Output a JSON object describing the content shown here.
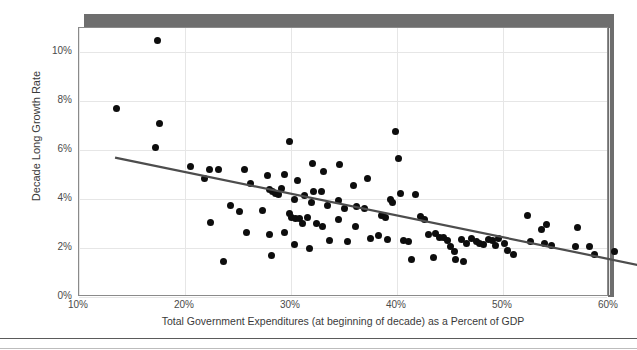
{
  "chart_data": {
    "type": "scatter",
    "title": "",
    "xlabel": "Total Government Expenditures (at beginning of decade) as a Percent of GDP",
    "ylabel": "Decade Long Growth Rate",
    "xlim": [
      10,
      60
    ],
    "ylim": [
      0,
      11
    ],
    "xticks": [
      "10%",
      "20%",
      "30%",
      "40%",
      "50%",
      "60%"
    ],
    "xtick_values": [
      10,
      20,
      30,
      40,
      50,
      60
    ],
    "yticks": [
      "0%",
      "2%",
      "4%",
      "6%",
      "8%",
      "10%"
    ],
    "ytick_values": [
      0,
      2,
      4,
      6,
      8,
      10
    ],
    "grid": true,
    "legend": "none",
    "marker_color": "#0d0d0d",
    "trendline_color": "#4d4d4d",
    "frame_color": "#8a8a8a",
    "shadow_color": "#6e6e6e",
    "trendline": {
      "type": "linear",
      "x_start": 13.4,
      "y_start": 5.7,
      "x_end": 64.0,
      "y_end": 1.2,
      "slope": -0.089,
      "intercept": 6.89
    },
    "points": [
      [
        17.4,
        10.5
      ],
      [
        13.5,
        7.7
      ],
      [
        17.6,
        7.1
      ],
      [
        17.2,
        6.1
      ],
      [
        39.9,
        6.75
      ],
      [
        29.9,
        6.35
      ],
      [
        40.1,
        5.65
      ],
      [
        20.5,
        5.35
      ],
      [
        22.3,
        5.2
      ],
      [
        23.2,
        5.2
      ],
      [
        25.6,
        5.2
      ],
      [
        32.0,
        5.45
      ],
      [
        33.1,
        5.15
      ],
      [
        34.6,
        5.4
      ],
      [
        21.8,
        4.85
      ],
      [
        27.8,
        4.95
      ],
      [
        29.4,
        5.0
      ],
      [
        30.6,
        4.75
      ],
      [
        32.1,
        4.3
      ],
      [
        32.9,
        4.3
      ],
      [
        35.9,
        4.55
      ],
      [
        37.2,
        4.85
      ],
      [
        26.2,
        4.65
      ],
      [
        28.0,
        4.4
      ],
      [
        28.3,
        4.3
      ],
      [
        28.5,
        4.25
      ],
      [
        28.8,
        4.2
      ],
      [
        29.1,
        4.45
      ],
      [
        30.3,
        4.0
      ],
      [
        31.3,
        4.15
      ],
      [
        31.9,
        3.85
      ],
      [
        33.4,
        3.75
      ],
      [
        34.5,
        3.95
      ],
      [
        35.0,
        3.6
      ],
      [
        36.2,
        3.7
      ],
      [
        36.9,
        3.6
      ],
      [
        24.3,
        3.75
      ],
      [
        25.1,
        3.5
      ],
      [
        27.3,
        3.55
      ],
      [
        29.9,
        3.4
      ],
      [
        30.0,
        3.25
      ],
      [
        30.4,
        3.2
      ],
      [
        30.8,
        3.2
      ],
      [
        31.1,
        3.0
      ],
      [
        31.6,
        3.25
      ],
      [
        32.4,
        3.0
      ],
      [
        33.0,
        2.9
      ],
      [
        34.5,
        3.15
      ],
      [
        22.4,
        3.05
      ],
      [
        25.8,
        2.65
      ],
      [
        28.0,
        2.55
      ],
      [
        29.4,
        2.65
      ],
      [
        30.3,
        2.15
      ],
      [
        31.7,
        2.0
      ],
      [
        33.6,
        2.3
      ],
      [
        28.2,
        1.7
      ],
      [
        23.6,
        1.45
      ],
      [
        38.5,
        3.35
      ],
      [
        38.9,
        3.25
      ],
      [
        39.4,
        4.0
      ],
      [
        39.6,
        3.85
      ],
      [
        40.3,
        4.25
      ],
      [
        41.7,
        4.2
      ],
      [
        42.2,
        3.3
      ],
      [
        42.6,
        3.15
      ],
      [
        43.0,
        2.55
      ],
      [
        43.6,
        2.6
      ],
      [
        44.0,
        2.45
      ],
      [
        44.4,
        2.45
      ],
      [
        38.3,
        2.5
      ],
      [
        39.1,
        2.35
      ],
      [
        40.6,
        2.3
      ],
      [
        41.1,
        2.25
      ],
      [
        37.5,
        2.4
      ],
      [
        44.8,
        2.3
      ],
      [
        45.0,
        2.05
      ],
      [
        45.4,
        1.85
      ],
      [
        46.1,
        2.35
      ],
      [
        46.6,
        2.2
      ],
      [
        47.0,
        2.4
      ],
      [
        47.5,
        2.25
      ],
      [
        47.8,
        2.2
      ],
      [
        48.2,
        2.15
      ],
      [
        48.6,
        2.35
      ],
      [
        49.0,
        2.3
      ],
      [
        49.3,
        2.1
      ],
      [
        49.6,
        2.4
      ],
      [
        50.1,
        2.2
      ],
      [
        50.4,
        1.9
      ],
      [
        45.5,
        1.55
      ],
      [
        46.3,
        1.45
      ],
      [
        43.4,
        1.6
      ],
      [
        52.3,
        3.35
      ],
      [
        53.6,
        2.75
      ],
      [
        52.6,
        2.25
      ],
      [
        53.9,
        2.2
      ],
      [
        54.6,
        2.1
      ],
      [
        51.0,
        1.75
      ],
      [
        54.1,
        2.95
      ],
      [
        57.0,
        2.85
      ],
      [
        56.8,
        2.05
      ],
      [
        58.2,
        2.05
      ],
      [
        58.6,
        1.75
      ],
      [
        60.5,
        1.85
      ],
      [
        36.1,
        2.9
      ],
      [
        35.3,
        2.25
      ],
      [
        41.4,
        1.55
      ]
    ]
  }
}
